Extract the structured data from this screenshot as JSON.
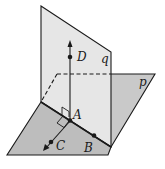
{
  "figure": {
    "planes": [
      {
        "id": "q",
        "label": "q",
        "orientation": "vertical"
      },
      {
        "id": "p",
        "label": "p",
        "orientation": "horizontal"
      }
    ],
    "points": [
      {
        "id": "A",
        "label": "A"
      },
      {
        "id": "B",
        "label": "B"
      },
      {
        "id": "C",
        "label": "C"
      },
      {
        "id": "D",
        "label": "D"
      }
    ],
    "colors": {
      "plane_q_fill": "#e4e4e4",
      "plane_p_fill": "#c4c4c4",
      "plane_p_front_fill": "#b9b9b9",
      "stroke": "#1a1a1a"
    }
  }
}
